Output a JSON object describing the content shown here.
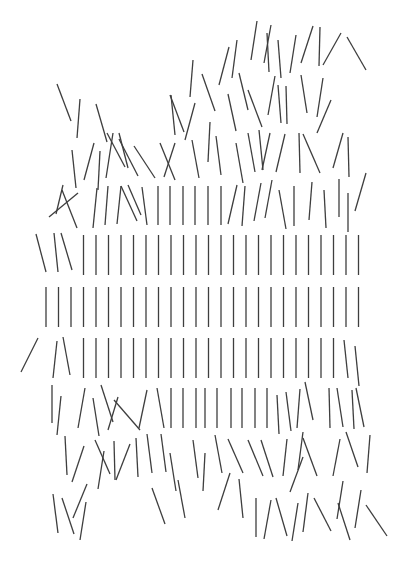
{
  "title": "Generative line-grid artwork (disorder increasing toward edges)",
  "line_color": "#3e3e3e",
  "background": "#ffffff",
  "grid": {
    "columns_x": [
      46,
      58.5,
      71,
      83.5,
      96,
      108.5,
      121,
      133.5,
      146,
      158.5,
      171,
      183.5,
      196,
      208.5,
      221,
      233.5,
      246,
      258.5,
      271,
      283.5,
      296,
      308.5,
      321,
      333.5,
      346,
      358.5
    ],
    "straight_rows": [
      {
        "name": "row-e",
        "y1": 235,
        "y2": 275,
        "skip_columns": [
          0,
          1,
          2
        ]
      },
      {
        "name": "row-f",
        "y1": 287,
        "y2": 327,
        "skip_columns": []
      },
      {
        "name": "row-g",
        "y1": 338,
        "y2": 378,
        "skip_columns": [
          0,
          1,
          2,
          24,
          25
        ]
      }
    ]
  },
  "segments": [
    [
      257,
      21,
      251,
      60
    ],
    [
      271,
      25,
      264,
      63
    ],
    [
      267,
      33,
      269,
      72
    ],
    [
      278,
      40,
      281,
      78
    ],
    [
      296,
      35,
      290,
      73
    ],
    [
      313,
      26,
      301,
      63
    ],
    [
      320,
      27,
      319,
      66
    ],
    [
      341,
      33,
      323,
      65
    ],
    [
      347,
      37,
      366,
      70
    ],
    [
      229,
      47,
      219,
      85
    ],
    [
      237,
      40,
      232,
      78
    ],
    [
      202,
      74,
      215,
      111
    ],
    [
      239,
      73,
      248,
      110
    ],
    [
      248,
      90,
      262,
      127
    ],
    [
      275,
      76,
      268,
      115
    ],
    [
      278,
      85,
      281,
      123
    ],
    [
      286,
      86,
      287,
      124
    ],
    [
      301,
      75,
      307,
      113
    ],
    [
      323,
      78,
      317,
      117
    ],
    [
      331,
      100,
      317,
      133
    ],
    [
      228,
      94,
      236,
      131
    ],
    [
      193,
      60,
      190,
      97
    ],
    [
      170,
      95,
      184,
      132
    ],
    [
      171,
      95,
      175,
      135
    ],
    [
      195,
      103,
      185,
      140
    ],
    [
      57,
      84,
      71,
      121
    ],
    [
      80,
      99,
      77,
      138
    ],
    [
      96,
      104,
      107,
      142
    ],
    [
      107,
      133,
      125,
      167
    ],
    [
      113,
      133,
      106,
      178
    ],
    [
      119,
      133,
      128,
      168
    ],
    [
      119,
      139,
      138,
      176
    ],
    [
      134,
      146,
      155,
      178
    ],
    [
      72,
      150,
      76,
      188
    ],
    [
      94,
      143,
      84,
      180
    ],
    [
      100,
      151,
      98,
      190
    ],
    [
      160,
      143,
      175,
      180
    ],
    [
      175,
      143,
      164,
      177
    ],
    [
      192,
      140,
      199,
      178
    ],
    [
      210,
      122,
      208,
      162
    ],
    [
      216,
      136,
      221,
      175
    ],
    [
      236,
      143,
      243,
      183
    ],
    [
      248,
      133,
      255,
      172
    ],
    [
      259,
      130,
      263,
      170
    ],
    [
      270,
      133,
      262,
      170
    ],
    [
      285,
      134,
      276,
      172
    ],
    [
      299,
      133,
      300,
      173
    ],
    [
      303,
      134,
      320,
      173
    ],
    [
      343,
      133,
      333,
      168
    ],
    [
      348,
      137,
      349,
      177
    ],
    [
      63,
      185,
      56,
      214
    ],
    [
      49,
      217,
      78,
      193
    ],
    [
      62,
      190,
      77,
      228
    ],
    [
      97,
      188,
      93,
      228
    ],
    [
      108,
      186,
      105,
      225
    ],
    [
      121,
      186,
      117,
      224
    ],
    [
      121,
      186,
      137,
      221
    ],
    [
      128,
      185,
      141,
      215
    ],
    [
      142,
      187,
      147,
      225
    ],
    [
      158,
      186,
      158,
      225
    ],
    [
      170,
      186,
      170,
      225
    ],
    [
      183,
      186,
      183,
      225
    ],
    [
      195,
      186,
      195,
      225
    ],
    [
      208,
      186,
      208,
      225
    ],
    [
      221,
      186,
      221,
      225
    ],
    [
      237,
      185,
      228,
      224
    ],
    [
      245,
      186,
      242,
      226
    ],
    [
      261,
      183,
      254,
      221
    ],
    [
      272,
      180,
      265,
      218
    ],
    [
      279,
      190,
      286,
      229
    ],
    [
      294,
      186,
      294,
      226
    ],
    [
      312,
      182,
      309,
      220
    ],
    [
      324,
      190,
      326,
      228
    ],
    [
      339,
      179,
      339,
      217
    ],
    [
      348,
      193,
      348,
      232
    ],
    [
      366,
      173,
      355,
      211
    ],
    [
      36,
      234,
      46,
      272
    ],
    [
      54,
      233,
      58,
      272
    ],
    [
      61,
      233,
      72,
      270
    ],
    [
      38,
      338,
      21,
      372
    ],
    [
      57,
      341,
      53,
      378
    ],
    [
      63,
      337,
      70,
      375
    ],
    [
      344,
      340,
      348,
      378
    ],
    [
      355,
      346,
      359,
      386
    ],
    [
      52,
      385,
      52,
      423
    ],
    [
      61,
      396,
      57,
      435
    ],
    [
      85,
      388,
      78,
      428
    ],
    [
      93,
      398,
      99,
      436
    ],
    [
      101,
      385,
      113,
      422
    ],
    [
      118,
      397,
      108,
      430
    ],
    [
      114,
      400,
      140,
      430
    ],
    [
      147,
      390,
      139,
      428
    ],
    [
      157,
      388,
      164,
      428
    ],
    [
      171,
      388,
      171,
      428
    ],
    [
      183,
      388,
      183,
      428
    ],
    [
      196,
      388,
      196,
      428
    ],
    [
      205,
      388,
      205,
      428
    ],
    [
      217,
      388,
      217,
      428
    ],
    [
      231,
      388,
      231,
      428
    ],
    [
      242,
      388,
      242,
      428
    ],
    [
      255,
      388,
      255,
      428
    ],
    [
      267,
      388,
      267,
      428
    ],
    [
      277,
      395,
      279,
      434
    ],
    [
      286,
      392,
      291,
      431
    ],
    [
      300,
      389,
      297,
      428
    ],
    [
      305,
      382,
      313,
      420
    ],
    [
      329,
      388,
      330,
      428
    ],
    [
      337,
      388,
      343,
      427
    ],
    [
      352,
      390,
      354,
      429
    ],
    [
      356,
      388,
      364,
      427
    ],
    [
      65,
      436,
      67,
      475
    ],
    [
      84,
      446,
      72,
      482
    ],
    [
      95,
      440,
      110,
      474
    ],
    [
      104,
      451,
      98,
      489
    ],
    [
      114,
      441,
      115,
      480
    ],
    [
      130,
      444,
      116,
      480
    ],
    [
      136,
      438,
      138,
      477
    ],
    [
      147,
      434,
      152,
      473
    ],
    [
      161,
      434,
      166,
      472
    ],
    [
      170,
      453,
      176,
      491
    ],
    [
      193,
      440,
      198,
      478
    ],
    [
      205,
      453,
      203,
      491
    ],
    [
      215,
      435,
      222,
      473
    ],
    [
      228,
      439,
      243,
      473
    ],
    [
      248,
      440,
      263,
      476
    ],
    [
      261,
      440,
      273,
      477
    ],
    [
      287,
      439,
      283,
      476
    ],
    [
      303,
      432,
      298,
      470
    ],
    [
      303,
      438,
      317,
      476
    ],
    [
      340,
      439,
      333,
      476
    ],
    [
      346,
      432,
      358,
      467
    ],
    [
      370,
      435,
      367,
      473
    ],
    [
      230,
      473,
      218,
      510
    ],
    [
      303,
      457,
      290,
      492
    ],
    [
      53,
      494,
      58,
      533
    ],
    [
      62,
      498,
      74,
      534
    ],
    [
      87,
      484,
      73,
      518
    ],
    [
      86,
      502,
      80,
      540
    ],
    [
      152,
      488,
      165,
      524
    ],
    [
      178,
      480,
      185,
      518
    ],
    [
      239,
      479,
      243,
      518
    ],
    [
      256,
      498,
      256,
      537
    ],
    [
      271,
      500,
      264,
      539
    ],
    [
      276,
      498,
      287,
      536
    ],
    [
      298,
      503,
      292,
      541
    ],
    [
      308,
      493,
      303,
      532
    ],
    [
      314,
      498,
      331,
      531
    ],
    [
      343,
      481,
      337,
      519
    ],
    [
      338,
      503,
      350,
      540
    ],
    [
      361,
      490,
      355,
      528
    ],
    [
      366,
      505,
      387,
      536
    ]
  ]
}
